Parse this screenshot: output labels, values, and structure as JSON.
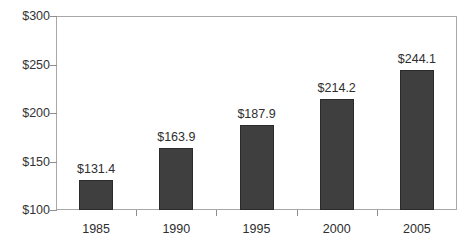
{
  "chart_data": {
    "type": "bar",
    "title": "",
    "subtitle": "",
    "xlabel": "",
    "ylabel": "",
    "categories": [
      "1985",
      "1990",
      "1995",
      "2000",
      "2005"
    ],
    "values": [
      131.4,
      163.9,
      187.9,
      214.2,
      244.1
    ],
    "data_labels": [
      "$131.4",
      "$163.9",
      "$187.9",
      "$214.2",
      "$244.1"
    ],
    "ylim": [
      100,
      300
    ],
    "ytick_values": [
      100,
      150,
      200,
      250,
      300
    ],
    "ytick_labels": [
      "$100",
      "$150",
      "$200",
      "$250",
      "$300"
    ],
    "grid": false,
    "legend": false,
    "legend_position": "none",
    "bar_color": "#3f3f3f",
    "frame_color": "#a8a8a8",
    "background_color": "#ffffff",
    "axis_note": "value axis starts at $100, bars are truncated at the baseline"
  }
}
